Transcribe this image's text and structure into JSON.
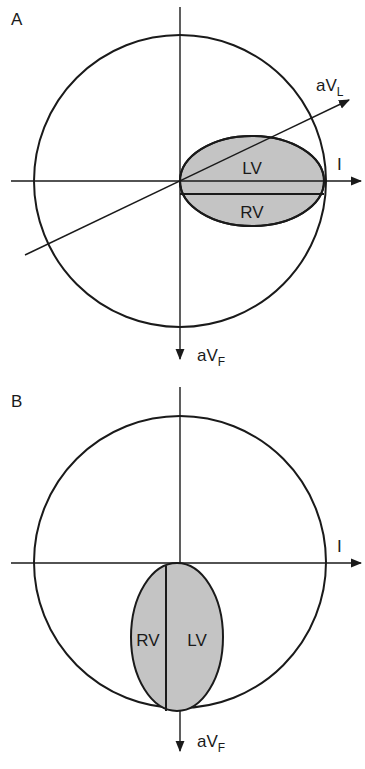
{
  "figure": {
    "panel_a": {
      "label": "A",
      "ellipse_orientation": "horizontal",
      "leads": {
        "lead_i": "I",
        "avl_main": "aV",
        "avl_sub": "L",
        "avf_main": "aV",
        "avf_sub": "F"
      },
      "chambers": {
        "upper": "LV",
        "lower": "RV"
      }
    },
    "panel_b": {
      "label": "B",
      "ellipse_orientation": "vertical",
      "leads": {
        "lead_i": "I",
        "avf_main": "aV",
        "avf_sub": "F"
      },
      "chambers": {
        "left": "RV",
        "right": "LV"
      }
    },
    "colors": {
      "stroke": "#1a1a1a",
      "ventricle_fill": "#c4c4c4",
      "background": "#ffffff"
    }
  }
}
